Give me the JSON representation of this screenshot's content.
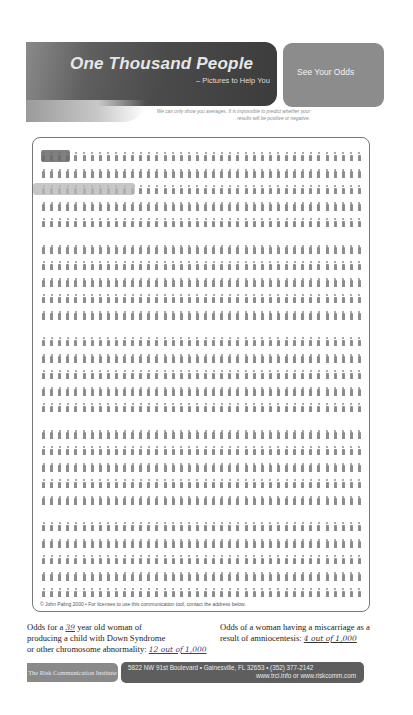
{
  "header": {
    "title": "One Thousand People",
    "subtitle": "– Pictures to Help You",
    "cta_label": "See Your Odds",
    "disclaimer": "We can only show you averages. It is impossible to predict whether your results will be positive or negative."
  },
  "grid": {
    "total_people": 1000,
    "groups_per_row": 4,
    "people_per_group": 10,
    "rows": 25,
    "rows_per_block": 5,
    "highlights": [
      {
        "label": "miscarriage-after-amniocentesis",
        "row": 1,
        "count": 4,
        "shade": "dark"
      },
      {
        "label": "down-syndrome-or-chromosome-abnormality",
        "row": 3,
        "count": 12,
        "shade": "light"
      }
    ],
    "footnote": "© John Paling 2000 • For licenses to use this communication tool, contact the address below."
  },
  "odds": {
    "left": {
      "prefix": "Odds for a",
      "age": "39",
      "line1_suffix": "year old woman of",
      "line2": "producing a child with Down Syndrome",
      "line3": "or other chromosome abnormality:",
      "value": "12 out of 1,000"
    },
    "right": {
      "line1": "Odds of a woman having a miscarriage as a",
      "line2": "result of amniocentesis:",
      "value": "4 out of 1,000"
    }
  },
  "footer": {
    "institute": "The Risk Communication Institute",
    "address": "5822 NW 91st Boulevard • Gainesville, FL 32653 • (352) 377-2142",
    "web": "www.trci.info or www.riskcomm.com"
  },
  "colors": {
    "figure": "#8d8d8d",
    "highlight_dark": "#6a6a6a",
    "highlight_light": "#b9b9b9"
  }
}
